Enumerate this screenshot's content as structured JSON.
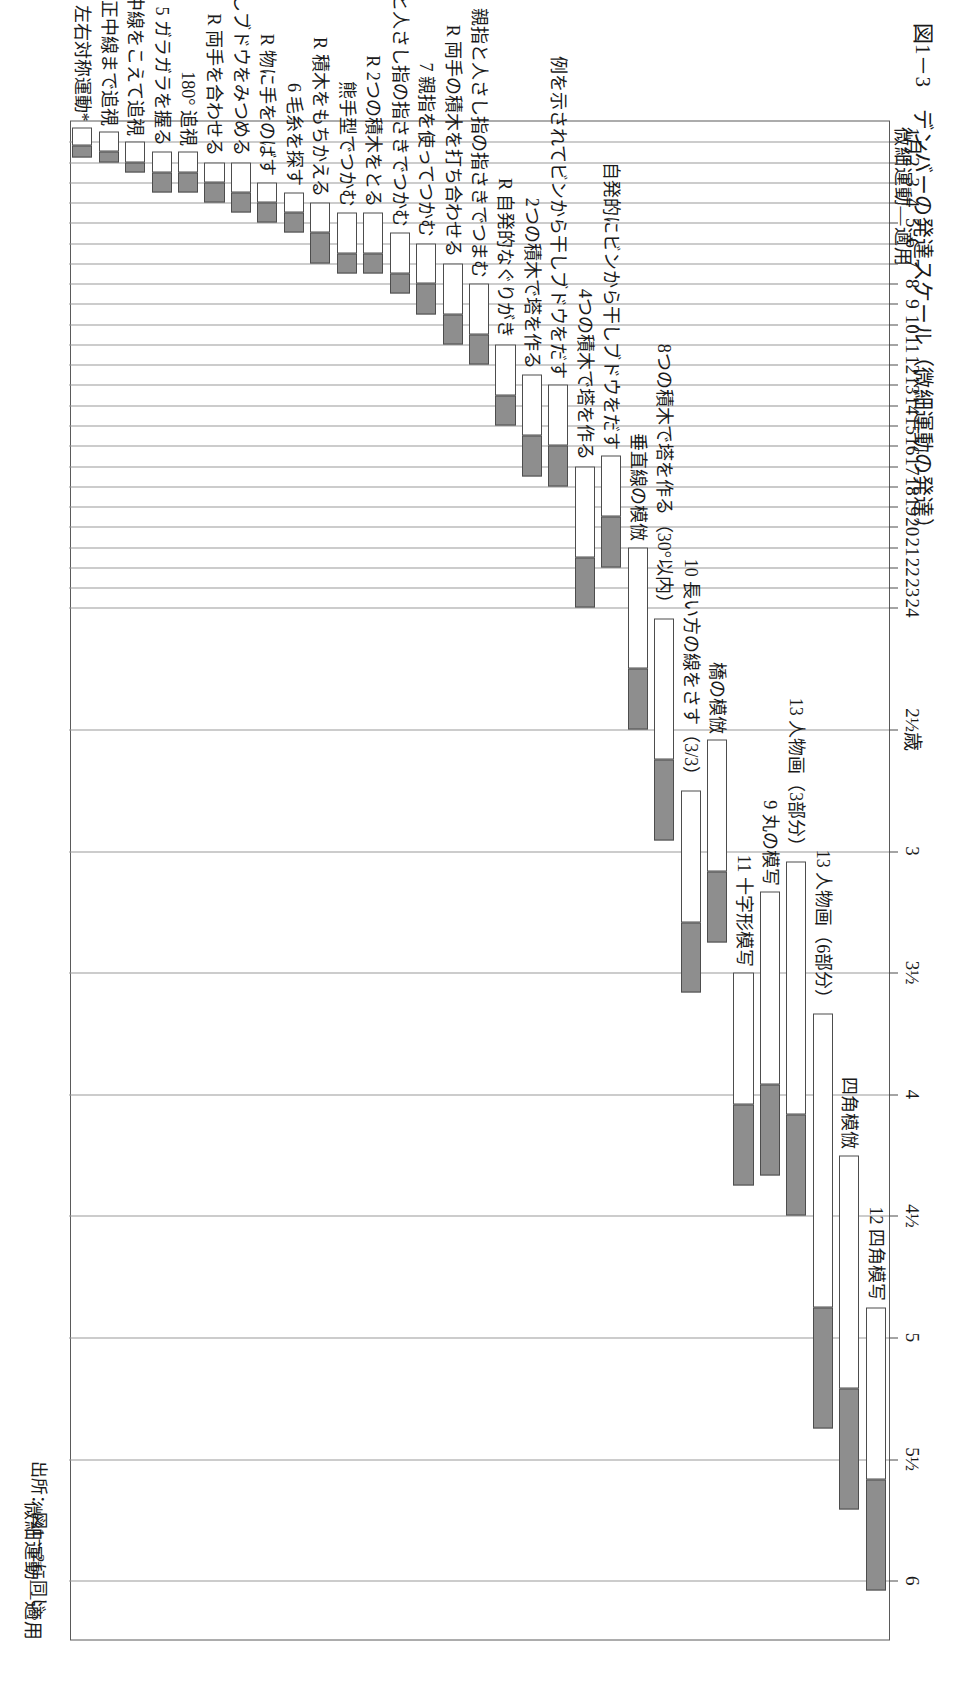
{
  "figure": {
    "title": "図1－3　デンバーの発達スケール（微細運動の発達）",
    "source": "出所：図1－2に同じ。",
    "category_header_left": "微細運動―適用",
    "category_header_right": "微細運動―適用"
  },
  "chart_data": {
    "type": "bar",
    "title": "図1－3　デンバーの発達スケール（微細運動の発達）",
    "subtitle": "微細運動―適用",
    "xlabel": "",
    "ylabel": "月齢／年齢",
    "grid": true,
    "legend_position": "none",
    "orientation": "horizontal-rotated",
    "axis_ticks": [
      "1月",
      "2",
      "3",
      "4",
      "5",
      "6",
      "7",
      "8",
      "9",
      "10",
      "11",
      "12",
      "13",
      "14",
      "15",
      "16",
      "17",
      "18",
      "19",
      "20",
      "21",
      "22",
      "23",
      "24",
      "2½歳",
      "3",
      "3½",
      "4",
      "4½",
      "5",
      "5½",
      "6"
    ],
    "axis_tick_values": [
      1,
      2,
      3,
      4,
      5,
      6,
      7,
      8,
      9,
      10,
      11,
      12,
      13,
      14,
      15,
      16,
      17,
      18,
      19,
      20,
      21,
      22,
      23,
      24,
      30,
      36,
      42,
      48,
      54,
      60,
      66,
      72
    ],
    "axis_range_months": [
      0,
      75
    ],
    "series": [
      {
        "name": "25-75%",
        "color": "#ffffff"
      },
      {
        "name": "75-90%",
        "color": "#8e8e8e"
      }
    ],
    "items": [
      {
        "label": "12 四角模写",
        "p25": 58.5,
        "p75": 67.0,
        "p90": 72.5
      },
      {
        "label": "四角模倣",
        "p25": 51.0,
        "p75": 62.5,
        "p90": 68.5
      },
      {
        "label": "13 人物画（6部分）",
        "p25": 44.0,
        "p75": 58.5,
        "p90": 64.5
      },
      {
        "label": "13 人物画（3部分）",
        "p25": 36.5,
        "p75": 49.0,
        "p90": 54.0
      },
      {
        "label": "9 丸の模写",
        "p25": 38.0,
        "p75": 47.5,
        "p90": 52.0
      },
      {
        "label": "11 十字形模写",
        "p25": 42.0,
        "p75": 48.5,
        "p90": 52.5
      },
      {
        "label": "橋の模倣",
        "p25": 30.5,
        "p75": 37.0,
        "p90": 40.5
      },
      {
        "label": "10 長い方の線をさす（3/3）",
        "p25": 33.0,
        "p75": 39.5,
        "p90": 43.0
      },
      {
        "label": "8つの積木で塔を作る（30°以内）",
        "p25": 24.5,
        "p75": 31.5,
        "p90": 35.5
      },
      {
        "label": "垂直線の模倣",
        "p25": 21.0,
        "p75": 27.0,
        "p90": 30.0
      },
      {
        "label": "自発的にビンから干しブドウをだす",
        "p25": 16.5,
        "p75": 19.5,
        "p90": 22.0
      },
      {
        "label": "4つの積木で塔を作る",
        "p25": 17.0,
        "p75": 21.5,
        "p90": 24.0
      },
      {
        "label": "例を示されてビンから干しブドウをだす",
        "p25": 13.0,
        "p75": 16.0,
        "p90": 18.0
      },
      {
        "label": "2つの積木で塔を作る",
        "p25": 12.5,
        "p75": 15.5,
        "p90": 17.5
      },
      {
        "label": "R 自発的なぐりがき",
        "p25": 11.0,
        "p75": 13.5,
        "p90": 15.0
      },
      {
        "label": "親指と人さし指の指さきでつまむ",
        "p25": 8.0,
        "p75": 10.5,
        "p90": 12.0
      },
      {
        "label": "R 両手の積木を打ち合わせる",
        "p25": 7.0,
        "p75": 9.5,
        "p90": 11.0
      },
      {
        "label": "7 親指を使ってつかむ",
        "p25": 6.0,
        "p75": 8.0,
        "p90": 9.5
      },
      {
        "label": "8 親指と人さし指の指さきでつかむ",
        "p25": 5.5,
        "p75": 7.5,
        "p90": 8.5
      },
      {
        "label": "R 2つの積木をとる",
        "p25": 4.5,
        "p75": 6.5,
        "p90": 7.5
      },
      {
        "label": "熊手型でつかむ",
        "p25": 4.5,
        "p75": 6.5,
        "p90": 7.5
      },
      {
        "label": "R 積木をもちかえる",
        "p25": 4.0,
        "p75": 5.5,
        "p90": 7.0
      },
      {
        "label": "6 毛糸を探す",
        "p25": 3.5,
        "p75": 4.5,
        "p90": 5.5
      },
      {
        "label": "R 物に手をのばす",
        "p25": 3.0,
        "p75": 4.0,
        "p90": 5.0
      },
      {
        "label": "干しブドウをみつめる",
        "p25": 2.0,
        "p75": 3.5,
        "p90": 4.5
      },
      {
        "label": "R 両手を合わせる",
        "p25": 2.0,
        "p75": 3.0,
        "p90": 4.0
      },
      {
        "label": "180° 追視",
        "p25": 1.5,
        "p75": 2.5,
        "p90": 3.5
      },
      {
        "label": "5 ガラガラを握る",
        "p25": 1.5,
        "p75": 2.5,
        "p90": 3.5
      },
      {
        "label": "4 正中線をこえて追視",
        "p25": 1.0,
        "p75": 2.0,
        "p90": 2.5
      },
      {
        "label": "4 正中線まで追視",
        "p25": 0.5,
        "p75": 1.5,
        "p90": 2.0
      },
      {
        "label": "左右対称運動*",
        "p25": 0.3,
        "p75": 1.2,
        "p90": 1.8
      }
    ]
  }
}
